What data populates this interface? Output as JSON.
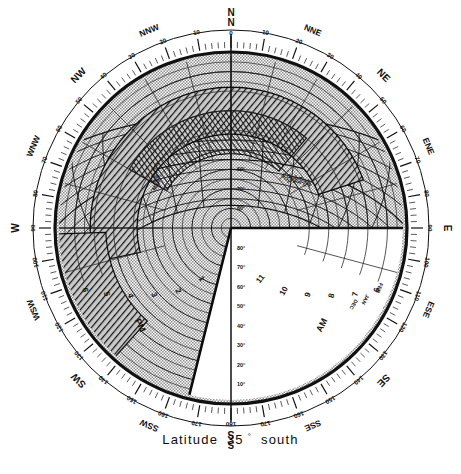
{
  "figure": {
    "type": "sun-path-stereographic-chart",
    "caption_prefix": "Latitude",
    "caption_value": "35",
    "caption_degree": "°",
    "caption_suffix": "south",
    "caption_full": "Latitude 35° south"
  },
  "colors": {
    "ink": "#111111",
    "paper": "#ffffff",
    "light_shade": "#b9b9b9",
    "dark_shade": "#3a3a3a",
    "grid": "#2a2a2a"
  },
  "compass": {
    "points": [
      {
        "label": "N",
        "bearing": 0
      },
      {
        "label": "NNE",
        "bearing": 22.5
      },
      {
        "label": "NE",
        "bearing": 45
      },
      {
        "label": "ENE",
        "bearing": 67.5
      },
      {
        "label": "E",
        "bearing": 90
      },
      {
        "label": "ESE",
        "bearing": 112.5
      },
      {
        "label": "SE",
        "bearing": 135
      },
      {
        "label": "SSE",
        "bearing": 157.5
      },
      {
        "label": "S",
        "bearing": 180
      },
      {
        "label": "SSW",
        "bearing": 202.5
      },
      {
        "label": "SW",
        "bearing": 225
      },
      {
        "label": "WSW",
        "bearing": 247.5
      },
      {
        "label": "W",
        "bearing": 270
      },
      {
        "label": "WNW",
        "bearing": 292.5
      },
      {
        "label": "NW",
        "bearing": 315
      },
      {
        "label": "NNW",
        "bearing": 337.5
      }
    ]
  },
  "azimuth_scale": {
    "unit": "degrees",
    "step_major": 10,
    "step_minor": 2,
    "east_labels": [
      {
        "text": "0",
        "bearing": 0
      },
      {
        "text": "10",
        "bearing": 10
      },
      {
        "text": "20",
        "bearing": 20
      },
      {
        "text": "30",
        "bearing": 30
      },
      {
        "text": "40",
        "bearing": 40
      },
      {
        "text": "50",
        "bearing": 50
      },
      {
        "text": "60",
        "bearing": 60
      },
      {
        "text": "70",
        "bearing": 70
      },
      {
        "text": "80",
        "bearing": 80
      },
      {
        "text": "90",
        "bearing": 90
      },
      {
        "text": "100",
        "bearing": 100
      },
      {
        "text": "110",
        "bearing": 110
      },
      {
        "text": "120",
        "bearing": 120
      },
      {
        "text": "130",
        "bearing": 130
      },
      {
        "text": "140",
        "bearing": 140
      },
      {
        "text": "150",
        "bearing": 150
      },
      {
        "text": "160",
        "bearing": 160
      },
      {
        "text": "170",
        "bearing": 170
      },
      {
        "text": "180",
        "bearing": 180
      }
    ],
    "west_labels": [
      {
        "text": "10",
        "bearing": 350
      },
      {
        "text": "20",
        "bearing": 340
      },
      {
        "text": "30",
        "bearing": 330
      },
      {
        "text": "40",
        "bearing": 320
      },
      {
        "text": "50",
        "bearing": 310
      },
      {
        "text": "60",
        "bearing": 300
      },
      {
        "text": "70",
        "bearing": 290
      },
      {
        "text": "80",
        "bearing": 280
      },
      {
        "text": "90",
        "bearing": 270
      },
      {
        "text": "100",
        "bearing": 260
      },
      {
        "text": "110",
        "bearing": 250
      },
      {
        "text": "120",
        "bearing": 240
      },
      {
        "text": "130",
        "bearing": 230
      },
      {
        "text": "140",
        "bearing": 220
      },
      {
        "text": "150",
        "bearing": 210
      },
      {
        "text": "160",
        "bearing": 200
      },
      {
        "text": "170",
        "bearing": 190
      }
    ]
  },
  "altitude_circles": {
    "unit": "degrees",
    "labels": [
      "10°",
      "20°",
      "30°",
      "40°",
      "50°",
      "60°",
      "70°",
      "80°"
    ],
    "values": [
      10,
      20,
      30,
      40,
      50,
      60,
      70,
      80
    ],
    "horizon": 0,
    "zenith": 90
  },
  "hour_lines": {
    "am_label": "AM",
    "pm_label": "PM",
    "am_hours": [
      "5",
      "6",
      "7",
      "8",
      "9",
      "10",
      "11"
    ],
    "pm_hours": [
      "1",
      "2",
      "3",
      "4",
      "5",
      "6",
      "7"
    ],
    "noon": "12"
  },
  "month_curves": {
    "labels": [
      "JAN",
      "FEB",
      "MAR",
      "APR",
      "MAY",
      "JUN",
      "JUL",
      "AUG",
      "SEP",
      "OCT",
      "NOV",
      "DEC"
    ],
    "solstice_summer": "DEC",
    "solstice_winter": "JUN",
    "equinox": "MAR / SEP"
  },
  "overlay": {
    "light_mask_name": "shading-mask-light",
    "dark_mask_name": "shading-mask-dark",
    "description": "shaded obstruction / overheated period band"
  }
}
